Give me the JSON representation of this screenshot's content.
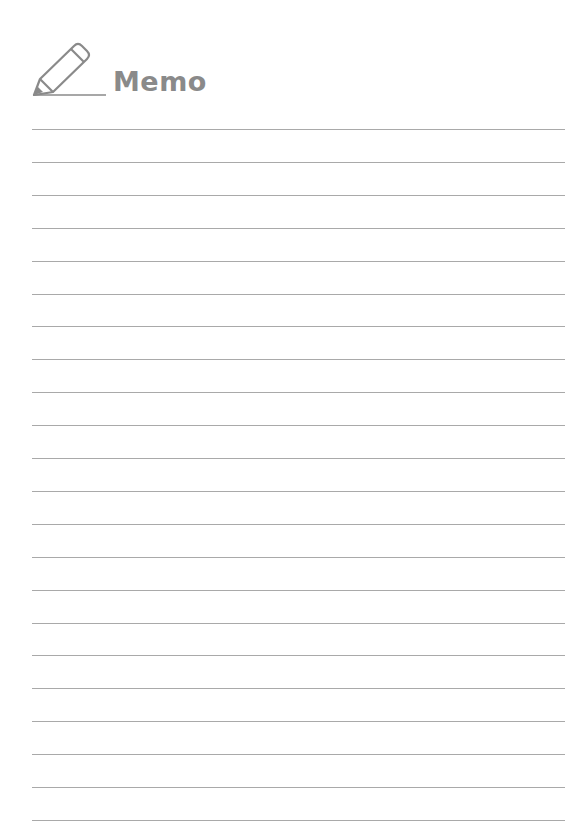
{
  "header": {
    "icon": "pencil-icon",
    "title": "Memo"
  },
  "page": {
    "line_count": 22,
    "first_line_y": 129,
    "line_spacing": 32.9,
    "line_color": "#a9a9a9",
    "title_color": "#8a8a8a"
  }
}
